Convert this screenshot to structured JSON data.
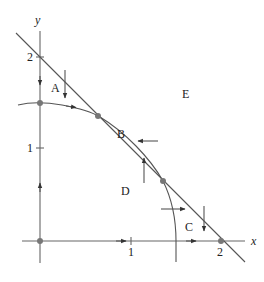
{
  "diagram": {
    "type": "phase-plane",
    "axes": {
      "x_label": "x",
      "y_label": "y",
      "x_ticks": [
        "1",
        "2"
      ],
      "y_ticks": [
        "1",
        "2"
      ]
    },
    "regions": {
      "A": "A",
      "B": "B",
      "C": "C",
      "D": "D",
      "E": "E"
    },
    "curves": {
      "line": "straight nullcline from (0,2) to (2,0)",
      "arc": "curved nullcline through (0,1.5) meeting the line twice"
    },
    "equilibria": [
      {
        "name": "origin",
        "x": 0,
        "y": 0
      },
      {
        "name": "y-axis point",
        "x": 0,
        "y": 1.5
      },
      {
        "name": "upper intersection",
        "x": 0.64,
        "y": 1.36
      },
      {
        "name": "lower intersection",
        "x": 1.36,
        "y": 0.65
      },
      {
        "name": "x-axis point",
        "x": 2,
        "y": 0
      }
    ],
    "colors": {
      "stroke": "#555555",
      "dot": "#777777",
      "text": "#222222"
    }
  }
}
